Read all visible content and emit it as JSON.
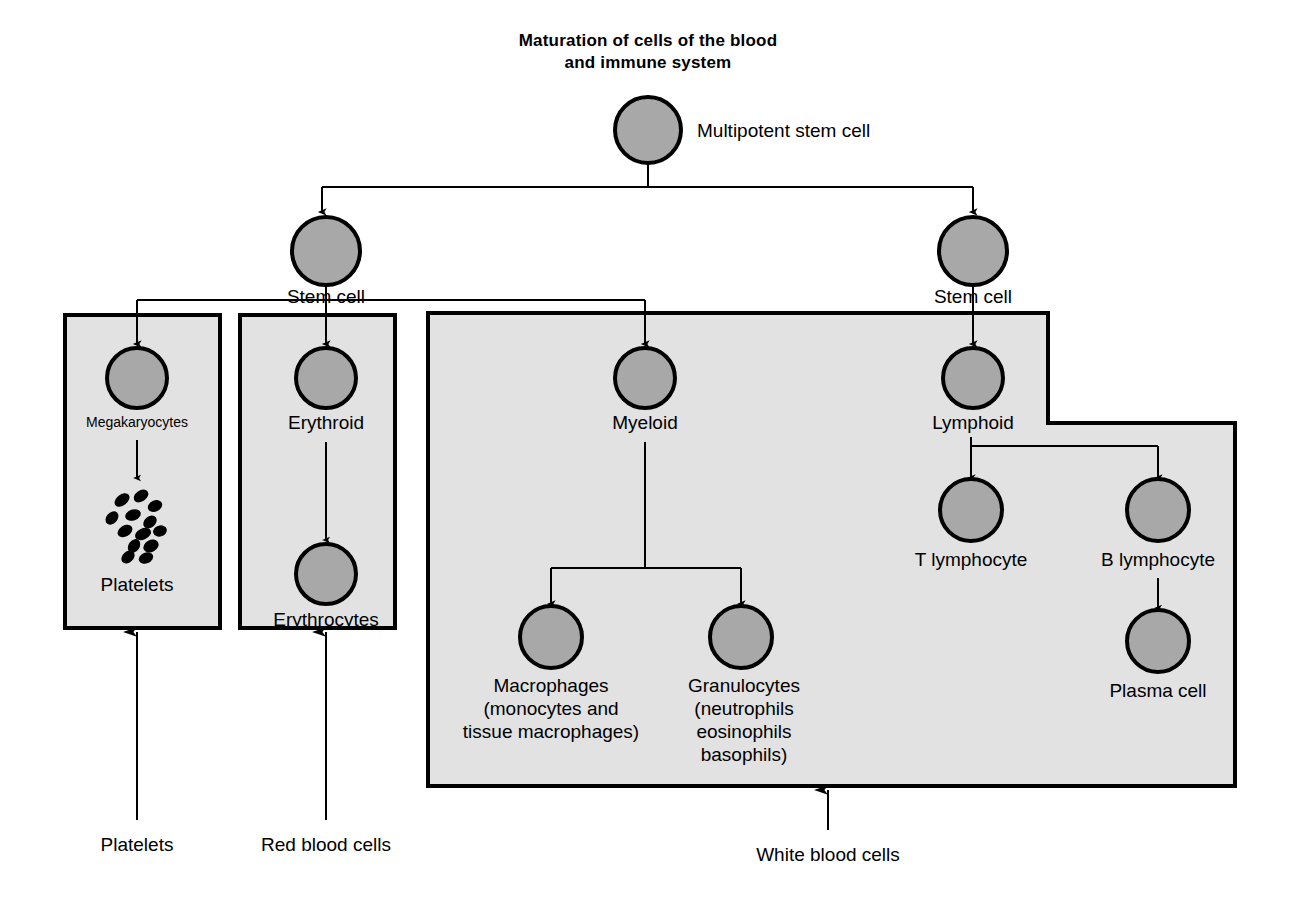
{
  "title": {
    "line1": "Maturation of cells of the blood",
    "line2": "and immune system"
  },
  "colors": {
    "cell_fill": "#a8a8a8",
    "cell_stroke": "#000000",
    "box_fill": "#e2e2e2",
    "box_stroke": "#000000",
    "background": "#ffffff",
    "text": "#000000"
  },
  "nodes": {
    "multipotent_stem_cell": "Multipotent stem cell",
    "stem_cell_left": "Stem cell",
    "stem_cell_right": "Stem cell",
    "megakaryocytes": "Megakaryocytes",
    "platelets": "Platelets",
    "erythroid": "Erythroid",
    "erythrocytes": "Erythrocytes",
    "myeloid": "Myeloid",
    "macrophages_l1": "Macrophages",
    "macrophages_l2": "(monocytes and",
    "macrophages_l3": "tissue macrophages)",
    "granulocytes_l1": "Granulocytes",
    "granulocytes_l2": "(neutrophils",
    "granulocytes_l3": "eosinophils",
    "granulocytes_l4": "basophils)",
    "lymphoid": "Lymphoid",
    "t_lymphocyte": "T lymphocyte",
    "b_lymphocyte": "B lymphocyte",
    "plasma_cell": "Plasma cell"
  },
  "captions": {
    "platelets": "Platelets",
    "red_blood_cells": "Red blood cells",
    "white_blood_cells": "White blood cells"
  },
  "groups": {
    "platelet_box": "Platelets group",
    "erythroid_box": "Red blood cells group",
    "wbc_box": "White blood cells group"
  },
  "lineage": {
    "type": "tree",
    "root": "Multipotent stem cell",
    "edges": [
      {
        "from": "Multipotent stem cell",
        "to": "Stem cell"
      },
      {
        "from": "Multipotent stem cell",
        "to": "Stem cell"
      },
      {
        "from": "Stem cell",
        "to": "Megakaryocytes"
      },
      {
        "from": "Stem cell",
        "to": "Erythroid"
      },
      {
        "from": "Stem cell",
        "to": "Myeloid"
      },
      {
        "from": "Megakaryocytes",
        "to": "Platelets"
      },
      {
        "from": "Erythroid",
        "to": "Erythrocytes"
      },
      {
        "from": "Myeloid",
        "to": "Macrophages"
      },
      {
        "from": "Myeloid",
        "to": "Granulocytes"
      },
      {
        "from": "Stem cell",
        "to": "Lymphoid"
      },
      {
        "from": "Lymphoid",
        "to": "T lymphocyte"
      },
      {
        "from": "Lymphoid",
        "to": "B lymphocyte"
      },
      {
        "from": "B lymphocyte",
        "to": "Plasma cell"
      }
    ]
  }
}
